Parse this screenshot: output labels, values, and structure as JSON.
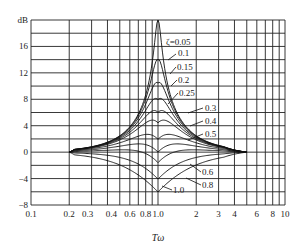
{
  "chart_data": {
    "type": "line",
    "title": "",
    "xlabel": "Tω",
    "ylabel": "dB",
    "xscale": "log",
    "xlim": [
      0.1,
      10
    ],
    "ylim": [
      -8,
      20
    ],
    "grid": true,
    "x_tick_labels": [
      "0.1",
      "0.2",
      "0.3",
      "0.4",
      "0.6",
      "0.8",
      "1.0",
      "2",
      "3",
      "4",
      "6",
      "8",
      "10"
    ],
    "x_tick_values": [
      0.1,
      0.2,
      0.3,
      0.4,
      0.6,
      0.8,
      1.0,
      2,
      3,
      4,
      6,
      8,
      10
    ],
    "y_tick_labels": [
      "16",
      "12",
      "8",
      "4",
      "0",
      "-4",
      "-8"
    ],
    "y_tick_values": [
      16,
      12,
      8,
      4,
      0,
      -4,
      -8
    ],
    "y_axis_unit_label": "dB",
    "legend_param_symbol": "ζ",
    "series": [
      {
        "name": "ζ=0.05",
        "zeta": 0.05,
        "peak_db": 20.0
      },
      {
        "name": "0.1",
        "zeta": 0.1,
        "peak_db": 14.0
      },
      {
        "name": "0.15",
        "zeta": 0.15,
        "peak_db": 10.5
      },
      {
        "name": "0.2",
        "zeta": 0.2,
        "peak_db": 8.0
      },
      {
        "name": "0.25",
        "zeta": 0.25,
        "peak_db": 6.0
      },
      {
        "name": "0.3",
        "zeta": 0.3,
        "peak_db": 4.4
      },
      {
        "name": "0.4",
        "zeta": 0.4,
        "peak_db": 1.9
      },
      {
        "name": "0.5",
        "zeta": 0.5,
        "peak_db": 0.0
      },
      {
        "name": "0.6",
        "zeta": 0.6,
        "peak_db": -1.6
      },
      {
        "name": "0.8",
        "zeta": 0.8,
        "peak_db": -4.1
      },
      {
        "name": "1.0",
        "zeta": 1.0,
        "peak_db": -6.0
      }
    ],
    "annotations": [
      "ζ=0.05",
      "0.1",
      "0.15",
      "0.2",
      "0.25",
      "0.3",
      "0.4",
      "0.5",
      "0.6",
      "0.8",
      "1.0"
    ],
    "x_range_of_curves": [
      0.2,
      5
    ]
  }
}
